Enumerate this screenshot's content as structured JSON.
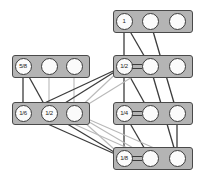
{
  "diagram": {
    "type": "node-link-diagram",
    "canvas": {
      "width": 199,
      "height": 177
    },
    "colors": {
      "background": "#ffffff",
      "panel_fill": "#b4b4b4",
      "panel_border": "#4a4a4a",
      "node_fill": "#fbfbfb",
      "node_border": "#3c3c3c",
      "edge_dark": "#3c3c3c",
      "edge_light": "#b9b9b9"
    },
    "panels": [
      {
        "id": "p-right-1",
        "column": "right",
        "row": 1,
        "x": 113,
        "y": 10,
        "w": 80,
        "h": 23,
        "nodes": [
          {
            "id": "r1n1",
            "label": "1",
            "cx": 124,
            "cy": 21
          },
          {
            "id": "r1n2",
            "label": "",
            "cx": 150,
            "cy": 21
          },
          {
            "id": "r1n3",
            "label": "",
            "cx": 177,
            "cy": 21
          }
        ],
        "equals": []
      },
      {
        "id": "p-left-1",
        "column": "left",
        "row": 2,
        "x": 12,
        "y": 55,
        "w": 78,
        "h": 23,
        "nodes": [
          {
            "id": "l1n1",
            "label": "5/8",
            "cx": 23,
            "cy": 66
          },
          {
            "id": "l1n2",
            "label": "",
            "cx": 49,
            "cy": 66
          },
          {
            "id": "l1n3",
            "label": "",
            "cx": 74,
            "cy": 66
          }
        ],
        "equals": []
      },
      {
        "id": "p-right-2",
        "column": "right",
        "row": 2,
        "x": 113,
        "y": 55,
        "w": 80,
        "h": 23,
        "nodes": [
          {
            "id": "r2n1",
            "label": "1/2",
            "cx": 124,
            "cy": 66
          },
          {
            "id": "r2n2",
            "label": "",
            "cx": 150,
            "cy": 66
          },
          {
            "id": "r2n3",
            "label": "",
            "cx": 177,
            "cy": 66
          }
        ],
        "equals": [
          {
            "from": "r2n1",
            "to": "r2n2"
          }
        ]
      },
      {
        "id": "p-left-2",
        "column": "left",
        "row": 3,
        "x": 12,
        "y": 102,
        "w": 78,
        "h": 23,
        "nodes": [
          {
            "id": "l2n1",
            "label": "1/6",
            "cx": 23,
            "cy": 113
          },
          {
            "id": "l2n2",
            "label": "1/2",
            "cx": 49,
            "cy": 113
          },
          {
            "id": "l2n3",
            "label": "",
            "cx": 74,
            "cy": 113
          }
        ],
        "equals": []
      },
      {
        "id": "p-right-3",
        "column": "right",
        "row": 3,
        "x": 113,
        "y": 102,
        "w": 80,
        "h": 23,
        "nodes": [
          {
            "id": "r3n1",
            "label": "1/4",
            "cx": 124,
            "cy": 113
          },
          {
            "id": "r3n2",
            "label": "",
            "cx": 150,
            "cy": 113
          },
          {
            "id": "r3n3",
            "label": "",
            "cx": 177,
            "cy": 113
          }
        ],
        "equals": [
          {
            "from": "r3n1",
            "to": "r3n2"
          }
        ]
      },
      {
        "id": "p-right-4",
        "column": "right",
        "row": 4,
        "x": 113,
        "y": 147,
        "w": 80,
        "h": 23,
        "nodes": [
          {
            "id": "r4n1",
            "label": "1/8",
            "cx": 124,
            "cy": 158
          },
          {
            "id": "r4n2",
            "label": "",
            "cx": 150,
            "cy": 158
          },
          {
            "id": "r4n3",
            "label": "",
            "cx": 177,
            "cy": 158
          }
        ],
        "equals": [
          {
            "from": "r4n1",
            "to": "r4n2"
          }
        ]
      }
    ],
    "edges": [
      {
        "from": "r1n1",
        "to": "r2n1",
        "shade": "dark"
      },
      {
        "from": "r1n1",
        "to": "r2n2",
        "shade": "dark"
      },
      {
        "from": "r1n2",
        "to": "r3n3",
        "shade": "dark"
      },
      {
        "from": "l1n1",
        "to": "l2n1",
        "shade": "dark"
      },
      {
        "from": "l1n1",
        "to": "l2n2",
        "shade": "dark"
      },
      {
        "from": "l1n2",
        "to": "l2n2",
        "shade": "light"
      },
      {
        "from": "l1n3",
        "to": "l2n3",
        "shade": "light"
      },
      {
        "from": "r2n1",
        "to": "r3n1",
        "shade": "dark"
      },
      {
        "from": "r2n1",
        "to": "r3n2",
        "shade": "dark"
      },
      {
        "from": "r2n2",
        "to": "r4n3",
        "shade": "dark"
      },
      {
        "from": "r2n1",
        "to": "l2n1",
        "shade": "dark"
      },
      {
        "from": "r2n1",
        "to": "l2n2",
        "shade": "dark"
      },
      {
        "from": "r2n1",
        "to": "l2n3",
        "shade": "light"
      },
      {
        "from": "r2n2",
        "to": "l2n3",
        "shade": "light"
      },
      {
        "from": "r3n1",
        "to": "r4n1",
        "shade": "dark"
      },
      {
        "from": "r3n1",
        "to": "r4n2",
        "shade": "dark"
      },
      {
        "from": "r3n3",
        "to": "r4n3",
        "shade": "dark"
      },
      {
        "from": "l2n1",
        "to": "r4n1",
        "shade": "dark"
      },
      {
        "from": "l2n2",
        "to": "r4n1",
        "shade": "dark"
      },
      {
        "from": "l2n3",
        "to": "r4n1",
        "shade": "light"
      },
      {
        "from": "l2n3",
        "to": "r4n2",
        "shade": "light"
      },
      {
        "from": "l2n3",
        "to": "r4n3",
        "shade": "light"
      },
      {
        "from": "l2n2",
        "to": "r4n2",
        "shade": "light"
      }
    ]
  }
}
